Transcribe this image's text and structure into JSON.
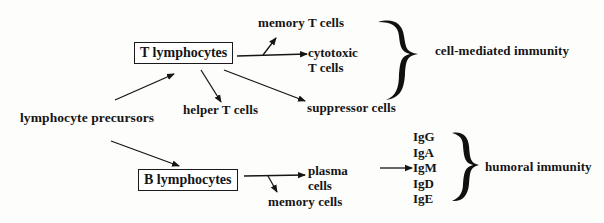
{
  "diagram": {
    "type": "flow",
    "nodes": {
      "precursors": "lymphocyte precursors",
      "t_lymphocytes": "T lymphocytes",
      "b_lymphocytes": "B lymphocytes",
      "memory_t": "memory T cells",
      "cytotoxic_line1": "cytotoxic",
      "cytotoxic_line2": "T cells",
      "helper_t": "helper T cells",
      "suppressor": "suppressor cells",
      "plasma_line1": "plasma",
      "plasma_line2": "cells",
      "memory_cells": "memory cells"
    },
    "immunoglobulins": [
      "IgG",
      "IgA",
      "IgM",
      "IgD",
      "IgE"
    ],
    "groups": {
      "cell_mediated": "cell-mediated immunity",
      "humoral": "humoral immunity"
    },
    "edges": [
      [
        "lymphocyte precursors",
        "T lymphocytes"
      ],
      [
        "lymphocyte precursors",
        "B lymphocytes"
      ],
      [
        "T lymphocytes",
        "helper T cells"
      ],
      [
        "T lymphocytes",
        "suppressor cells"
      ],
      [
        "T lymphocytes",
        "cytotoxic T cells"
      ],
      [
        "T lymphocytes",
        "memory T cells"
      ],
      [
        "B lymphocytes",
        "plasma cells"
      ],
      [
        "B lymphocytes",
        "memory cells"
      ],
      [
        "plasma cells",
        "IgM"
      ]
    ]
  }
}
